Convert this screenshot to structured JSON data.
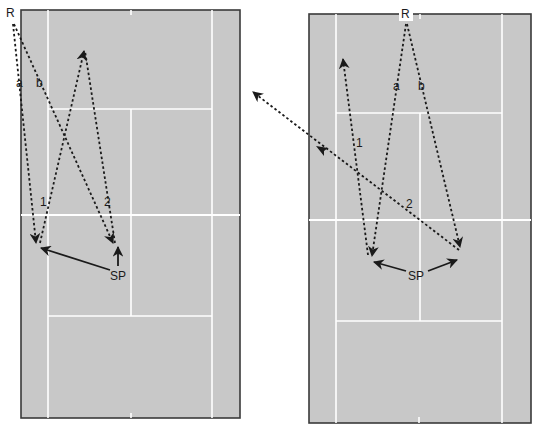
{
  "colors": {
    "court": "#c8c8c8",
    "court_border": "#3a3a3a",
    "court_lines": "#ffffff",
    "arrows": "#1a1a1a",
    "background": "#ffffff"
  },
  "left_court": {
    "labels": {
      "receiver": "R",
      "path_a": "a",
      "path_b": "b",
      "shot_1": "1",
      "shot_2": "2",
      "server_position": "SP"
    }
  },
  "right_court": {
    "labels": {
      "receiver": "R",
      "path_a": "a",
      "path_b": "b",
      "shot_1": "1",
      "shot_2": "2",
      "server_position": "SP"
    }
  }
}
